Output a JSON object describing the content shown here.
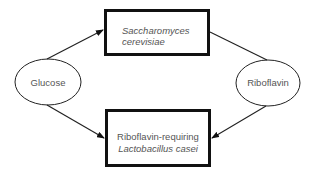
{
  "diagram": {
    "nodes": {
      "glucose": {
        "label": "Glucose",
        "shape": "ellipse"
      },
      "riboflavin": {
        "label": "Riboflavin",
        "shape": "ellipse"
      },
      "saccharomyces": {
        "line1": "Saccharomyces",
        "line2": "cerevisiae",
        "shape": "box"
      },
      "lactobacillus": {
        "line1": "Riboflavin-requiring",
        "line2": "Lactobacillus casei",
        "shape": "box"
      }
    },
    "edges": [
      {
        "from": "Glucose",
        "to": "Saccharomyces cerevisiae",
        "arrow": true
      },
      {
        "from": "Glucose",
        "to": "Riboflavin-requiring Lactobacillus casei",
        "arrow": true
      },
      {
        "from": "Saccharomyces cerevisiae",
        "to": "Riboflavin",
        "arrow": false
      },
      {
        "from": "Riboflavin",
        "to": "Riboflavin-requiring Lactobacillus casei",
        "arrow": true
      }
    ],
    "colors": {
      "stroke": "#111111",
      "text": "#555555",
      "background": "#ffffff"
    }
  }
}
